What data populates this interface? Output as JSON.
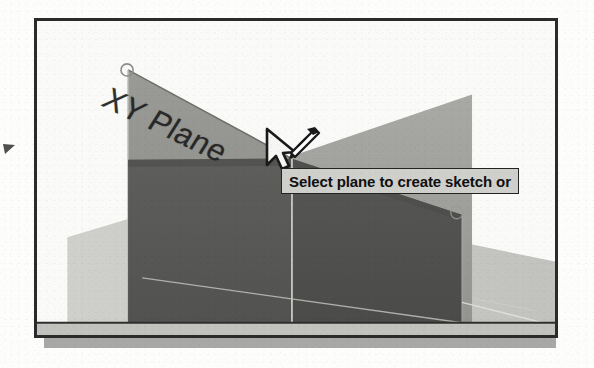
{
  "figure": {
    "kind": "cad-viewport-screenshot",
    "frame_border_color": "#2b2b2b",
    "shadow_color": "#a8a8a6",
    "background_color": "#fafaf8"
  },
  "viewport": {
    "label_xy_plane": "XY Plane",
    "planes": [
      {
        "name": "xy-plane",
        "label": "XY Plane",
        "fill": "#8f8f8c",
        "state": "highlighted"
      },
      {
        "name": "right-plane",
        "label": "",
        "fill": "#9d9d99",
        "state": "normal"
      },
      {
        "name": "ground-plane",
        "label": "",
        "fill": "#c8c8c4",
        "state": "normal"
      }
    ],
    "solid": {
      "name": "part-body",
      "front_face_fill": "#5a5a58",
      "side_face_fill": "#4e4e4c",
      "edge_color": "#d8d8d4"
    },
    "handles": [
      {
        "name": "plane-corner-handle",
        "x": 123,
        "y": 66
      },
      {
        "name": "plane-corner-handle",
        "x": 449,
        "y": 206
      }
    ]
  },
  "tooltip": {
    "text": "Select plane to create sketch or",
    "truncated": true,
    "background": "#cfcfcb",
    "border": "#232323"
  },
  "cursor": {
    "icon": "arrow-with-sketch-badge",
    "x": 240,
    "y": 115
  },
  "annotation": {
    "margin_mark": "leader-arrow"
  }
}
